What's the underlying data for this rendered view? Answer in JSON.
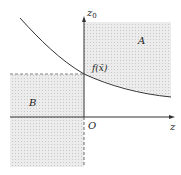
{
  "diagram": {
    "axis_x_label": "z",
    "axis_y_label": "z",
    "axis_y_subscript": "0",
    "origin_label": "O",
    "region_a_label": "A",
    "region_b_label": "B",
    "curve_label": "f(x̄)",
    "colors": {
      "shade": "#e4e4e4",
      "stroke": "#333333",
      "dashed": "#666666"
    }
  }
}
